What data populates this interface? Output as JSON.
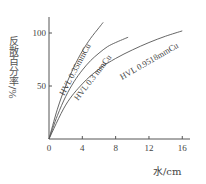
{
  "chart_data": {
    "type": "line",
    "title": "",
    "xlabel": "水/cm",
    "ylabel": "反散百分率/%",
    "xlim": [
      0,
      17
    ],
    "ylim": [
      0,
      110
    ],
    "xticks": [
      0,
      4,
      8,
      12,
      16
    ],
    "yticks": [
      50,
      100
    ],
    "grid": false,
    "legend": "inline labels along curves",
    "series": [
      {
        "name": "HVL 0.35mmCu",
        "x": [
          0,
          1,
          2,
          3,
          4,
          5,
          6,
          6.5
        ],
        "y": [
          0,
          28,
          50,
          68,
          83,
          95,
          105,
          110
        ]
      },
      {
        "name": "HVL 0.3 mmCu",
        "x": [
          0,
          1,
          2,
          3,
          4,
          5,
          6,
          7,
          8,
          9.5
        ],
        "y": [
          0,
          22,
          40,
          54,
          65,
          74,
          81,
          87,
          91,
          96
        ]
      },
      {
        "name": "HVL 0.9518mmCu",
        "x": [
          0,
          2,
          4,
          6,
          8,
          10,
          12,
          14,
          16
        ],
        "y": [
          0,
          32,
          52,
          66,
          76,
          84,
          91,
          97,
          102
        ]
      }
    ]
  },
  "labels": {
    "xlabel": "水/cm",
    "ylabel": "反散百分率/%"
  },
  "axes": {
    "x_ticks": [
      "0",
      "4",
      "8",
      "12",
      "16"
    ],
    "y_ticks": [
      "50",
      "100"
    ]
  },
  "colors": {
    "axis": "#555555",
    "line": "#555555",
    "text": "#444444"
  }
}
